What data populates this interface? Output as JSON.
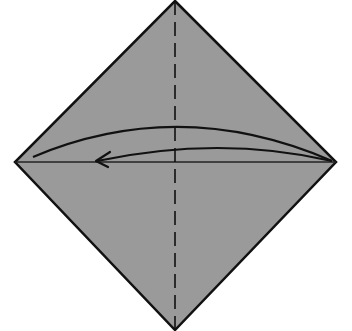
{
  "diagram": {
    "title": "Origami fold step: fold right corner to left corner",
    "colors": {
      "paper": "#9a9a9a",
      "outline": "#111111",
      "background": "#ffffff"
    },
    "diamond": {
      "top": [
        175,
        1
      ],
      "right": [
        336,
        162
      ],
      "bottom": [
        175,
        330
      ],
      "left": [
        15,
        162
      ]
    },
    "lines": {
      "crease_dashed": "vertical valley-fold guide through center",
      "diagonal_crease": "horizontal line from left to right corner"
    },
    "arrow": {
      "type": "fold-arrow",
      "direction": "right-to-left",
      "from": "right corner",
      "to": "left corner"
    }
  }
}
